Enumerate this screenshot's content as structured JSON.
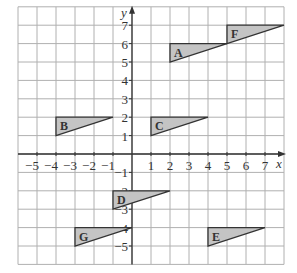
{
  "diagram": {
    "type": "coordinate-grid",
    "x_axis": {
      "label": "x",
      "min": -6,
      "max": 8,
      "tick_labels": [
        "−5",
        "−4",
        "−3",
        "−2",
        "−1",
        "1",
        "2",
        "3",
        "4",
        "5",
        "6",
        "7"
      ],
      "tick_values": [
        -5,
        -4,
        -3,
        -2,
        -1,
        1,
        2,
        3,
        4,
        5,
        6,
        7
      ]
    },
    "y_axis": {
      "label": "y",
      "min": -6,
      "max": 8,
      "tick_labels": [
        "7",
        "6",
        "5",
        "4",
        "3",
        "2",
        "1",
        "−1",
        "−2",
        "−3",
        "−4",
        "−5"
      ],
      "tick_values": [
        7,
        6,
        5,
        4,
        3,
        2,
        1,
        -1,
        -2,
        -3,
        -4,
        -5
      ]
    },
    "shapes": [
      {
        "label": "A",
        "vertices": [
          [
            2,
            6
          ],
          [
            2,
            5
          ],
          [
            5,
            6
          ]
        ]
      },
      {
        "label": "F",
        "vertices": [
          [
            5,
            7
          ],
          [
            5,
            6
          ],
          [
            8,
            7
          ]
        ]
      },
      {
        "label": "B",
        "vertices": [
          [
            -4,
            2
          ],
          [
            -4,
            1
          ],
          [
            -1,
            2
          ]
        ]
      },
      {
        "label": "C",
        "vertices": [
          [
            1,
            2
          ],
          [
            1,
            1
          ],
          [
            4,
            2
          ]
        ]
      },
      {
        "label": "D",
        "vertices": [
          [
            -1,
            -2
          ],
          [
            -1,
            -3
          ],
          [
            2,
            -2
          ]
        ]
      },
      {
        "label": "G",
        "vertices": [
          [
            -3,
            -4
          ],
          [
            -3,
            -5
          ],
          [
            0,
            -4
          ]
        ]
      },
      {
        "label": "E",
        "vertices": [
          [
            4,
            -4
          ],
          [
            4,
            -5
          ],
          [
            7,
            -4
          ]
        ]
      }
    ],
    "colors": {
      "grid": "#b0b0b0",
      "axis": "#333333",
      "fill": "#c4c4c4",
      "stroke": "#333333",
      "text": "#333333"
    }
  }
}
